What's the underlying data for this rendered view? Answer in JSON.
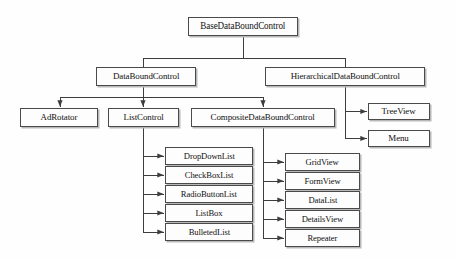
{
  "figure": {
    "kind": "class-hierarchy-diagram",
    "background_color": "#ffffff",
    "box_fill_color": "#fdfdfd",
    "box_border_color": "#4a4a4a",
    "shadow_color": "#b8b8b8",
    "connector_color": "#3d3d3d",
    "text_color": "#111111"
  },
  "nodes": {
    "root": {
      "label": "BaseDataBoundControl",
      "x": 188,
      "y": 17,
      "w": 110,
      "h": 19
    },
    "data_bound_control": {
      "label": "DataBoundControl",
      "x": 96,
      "y": 67,
      "w": 100,
      "h": 19
    },
    "hierarchical_data_bound_control": {
      "label": "HierarchicalDataBoundControl",
      "x": 265,
      "y": 67,
      "w": 160,
      "h": 19
    },
    "ad_rotator": {
      "label": "AdRotator",
      "x": 20,
      "y": 108,
      "w": 78,
      "h": 19
    },
    "list_control": {
      "label": "ListControl",
      "x": 108,
      "y": 108,
      "w": 71,
      "h": 19
    },
    "composite_data_bound_control": {
      "label": "CompositeDataBoundControl",
      "x": 191,
      "y": 108,
      "w": 144,
      "h": 19
    },
    "tree_view": {
      "label": "TreeView",
      "x": 368,
      "y": 103,
      "w": 62,
      "h": 17
    },
    "menu": {
      "label": "Menu",
      "x": 368,
      "y": 130,
      "w": 62,
      "h": 17
    }
  },
  "list_control_children": {
    "x": 165,
    "w": 88,
    "h": 18,
    "first_y": 147,
    "pitch": 19,
    "items": [
      {
        "label": "DropDownList"
      },
      {
        "label": "CheckBoxList"
      },
      {
        "label": "RadioButtonList"
      },
      {
        "label": "ListBox"
      },
      {
        "label": "BulletedList"
      }
    ]
  },
  "composite_children": {
    "x": 285,
    "w": 75,
    "h": 18,
    "first_y": 153,
    "pitch": 19,
    "items": [
      {
        "label": "GridView"
      },
      {
        "label": "FormView"
      },
      {
        "label": "DataList"
      },
      {
        "label": "DetailsView"
      },
      {
        "label": "Repeater"
      }
    ]
  },
  "edges": {
    "root_stem_x": 243,
    "root_stem_bottom": 58,
    "level1_bar_y": 58,
    "level1_bar_left": 143,
    "level1_bar_right": 345,
    "level2_bar_y": 97,
    "level2_bar_left": 60,
    "level2_bar_right": 263,
    "list_trunk_x": 143,
    "composite_trunk_x": 263,
    "hierarchical_trunk_x": 345
  }
}
